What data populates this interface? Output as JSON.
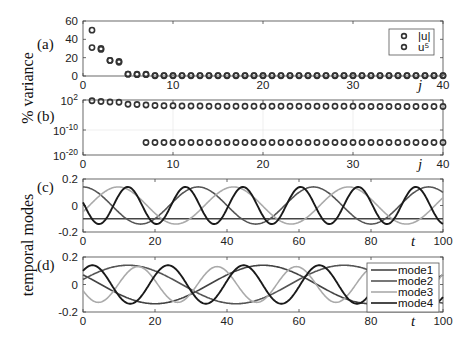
{
  "figure": {
    "ylabel_top": "% variance",
    "ylabel_bottom": "temporal modes"
  },
  "chart_data": [
    {
      "id": "a",
      "type": "scatter",
      "panel_label": "(a)",
      "title": "",
      "xlabel": "j",
      "ylabel": "% variance",
      "xlim": [
        0,
        40
      ],
      "ylim": [
        0,
        60
      ],
      "xticks": [
        0,
        10,
        20,
        30,
        40
      ],
      "yticks": [
        0,
        20,
        40,
        60
      ],
      "ytick_labels": [
        "0",
        "20",
        "40",
        "60"
      ],
      "xtick_labels": [
        "0",
        "10",
        "20",
        "30",
        "40"
      ],
      "grid": false,
      "legend": {
        "placement": "top-right",
        "entries": [
          "|u|",
          "u⁵"
        ]
      },
      "series": [
        {
          "name": "|u|",
          "x": [
            1,
            2,
            3,
            4,
            5,
            6,
            7,
            8,
            9,
            10,
            11,
            12,
            13,
            14,
            15,
            16,
            17,
            18,
            19,
            20,
            21,
            22,
            23,
            24,
            25,
            26,
            27,
            28,
            29,
            30,
            31,
            32,
            33,
            34,
            35,
            36,
            37,
            38,
            39,
            40
          ],
          "y": [
            50,
            30,
            17,
            16,
            2,
            2,
            2,
            0.5,
            0.5,
            0.5,
            0.5,
            0.5,
            0.5,
            0.5,
            0.5,
            0.5,
            0.5,
            0.5,
            0.5,
            0.5,
            0.5,
            0.5,
            0.5,
            0.5,
            0.5,
            0.5,
            0.5,
            0.5,
            0.5,
            0.5,
            0.5,
            0.5,
            0.5,
            0.5,
            0.5,
            0.5,
            0.5,
            0.5,
            0.5,
            0.5
          ]
        },
        {
          "name": "u⁵",
          "x": [
            1,
            2,
            3,
            4,
            5,
            6,
            7,
            8,
            9,
            10,
            11,
            12,
            13,
            14,
            15,
            16,
            17,
            18,
            19,
            20,
            21,
            22,
            23,
            24,
            25,
            26,
            27,
            28,
            29,
            30,
            31,
            32,
            33,
            34,
            35,
            36,
            37,
            38,
            39,
            40
          ],
          "y": [
            31,
            29,
            17,
            15,
            2,
            1.5,
            1.5,
            0.3,
            0.3,
            0.3,
            0.3,
            0.3,
            0.3,
            0.3,
            0.3,
            0.3,
            0.3,
            0.3,
            0.3,
            0.3,
            0.3,
            0.3,
            0.3,
            0.3,
            0.3,
            0.3,
            0.3,
            0.3,
            0.3,
            0.3,
            0.3,
            0.3,
            0.3,
            0.3,
            0.3,
            0.3,
            0.3,
            0.3,
            0.3,
            0.3
          ]
        }
      ]
    },
    {
      "id": "b",
      "type": "scatter",
      "panel_label": "(b)",
      "xlabel": "j",
      "ylabel": "% variance (log scale)",
      "xlim": [
        0,
        40
      ],
      "ylim_log10": [
        -20,
        2
      ],
      "xticks": [
        0,
        10,
        20,
        30,
        40
      ],
      "xtick_labels": [
        "0",
        "10",
        "20",
        "30",
        "40"
      ],
      "yticks_log10": [
        -20,
        -10,
        2
      ],
      "ytick_labels": [
        {
          "base": "10",
          "exp": "-20"
        },
        {
          "base": "10",
          "exp": "-10"
        },
        {
          "base": "10",
          "exp": "2"
        }
      ],
      "grid": true,
      "series": [
        {
          "name": "|u| log10",
          "x": [
            1,
            2,
            3,
            4,
            5,
            6,
            7,
            8,
            9,
            10,
            11,
            12,
            13,
            14,
            15,
            16,
            17,
            18,
            19,
            20,
            21,
            22,
            23,
            24,
            25,
            26,
            27,
            28,
            29,
            30,
            31,
            32,
            33,
            34,
            35,
            36,
            37,
            38,
            39,
            40
          ],
          "y_log10": [
            1.7,
            1.4,
            1.2,
            1.1,
            0.3,
            0.2,
            0,
            -0.2,
            -0.3,
            -0.3,
            -0.4,
            -0.4,
            -0.4,
            -0.5,
            -0.5,
            -0.5,
            -0.5,
            -0.5,
            -0.5,
            -0.5,
            -0.5,
            -0.5,
            -0.5,
            -0.5,
            -0.5,
            -0.5,
            -0.5,
            -0.5,
            -0.5,
            -0.5,
            -0.5,
            -0.6,
            -0.6,
            -0.6,
            -0.6,
            -0.6,
            -0.6,
            -0.6,
            -0.6,
            -0.6
          ]
        },
        {
          "name": "u⁵ log10",
          "x": [
            7,
            8,
            9,
            10,
            11,
            12,
            13,
            14,
            15,
            16,
            17,
            18,
            19,
            20,
            21,
            22,
            23,
            24,
            25,
            26,
            27,
            28,
            29,
            30,
            31,
            32,
            33,
            34,
            35,
            36,
            37,
            38,
            39,
            40
          ],
          "y_log10": [
            -15,
            -15,
            -15,
            -15,
            -15,
            -15,
            -15,
            -15,
            -15,
            -15,
            -15,
            -15,
            -15,
            -15,
            -15,
            -15,
            -15,
            -15,
            -15,
            -15,
            -15,
            -15,
            -15,
            -15,
            -15,
            -15,
            -15,
            -15,
            -15,
            -15,
            -15,
            -15,
            -15,
            -15
          ]
        }
      ]
    },
    {
      "id": "c",
      "type": "line",
      "panel_label": "(c)",
      "xlabel": "t",
      "ylabel": "temporal modes",
      "xlim": [
        0,
        100
      ],
      "ylim": [
        -0.2,
        0.2
      ],
      "xticks": [
        0,
        20,
        40,
        60,
        80,
        100
      ],
      "xtick_labels": [
        "0",
        "20",
        "40",
        "60",
        "80",
        "100"
      ],
      "yticks": [
        -0.2,
        0,
        0.2
      ],
      "ytick_labels": [
        "-0.2",
        "0",
        "0.2"
      ],
      "grid": false,
      "series": [
        {
          "name": "mode1",
          "color": "#444444",
          "kind": "constant",
          "value": -0.1
        },
        {
          "name": "mode2",
          "color": "#555555",
          "kind": "sine",
          "amplitude": 0.14,
          "period": 32,
          "phase_deg": 90
        },
        {
          "name": "mode3",
          "color": "#aaaaaa",
          "kind": "sine",
          "amplitude": 0.14,
          "period": 32,
          "phase_deg": -20
        },
        {
          "name": "mode4",
          "color": "#1a1a1a",
          "kind": "sine",
          "amplitude": 0.14,
          "period": 16,
          "phase_deg": 170
        }
      ]
    },
    {
      "id": "d",
      "type": "line",
      "panel_label": "(d)",
      "xlabel": "t",
      "ylabel": "temporal modes",
      "xlim": [
        0,
        100
      ],
      "ylim": [
        -0.2,
        0.2
      ],
      "xticks": [
        0,
        20,
        40,
        60,
        80,
        100
      ],
      "xtick_labels": [
        "0",
        "20",
        "40",
        "60",
        "80",
        "100"
      ],
      "yticks": [
        -0.2,
        0,
        0.2
      ],
      "ytick_labels": [
        "-0.2",
        "0",
        "0.2"
      ],
      "grid": false,
      "legend": {
        "placement": "bottom-right",
        "entries": [
          "mode1",
          "mode2",
          "mode3",
          "mode4"
        ]
      },
      "series": [
        {
          "name": "mode1",
          "color": "#444444",
          "kind": "sine",
          "amplitude": 0.14,
          "period": 60,
          "phase_deg": -90,
          "offset_t": -20
        },
        {
          "name": "mode2",
          "color": "#555555",
          "kind": "sine",
          "amplitude": 0.14,
          "period": 60,
          "phase_deg": 15
        },
        {
          "name": "mode3",
          "color": "#aaaaaa",
          "kind": "sine",
          "amplitude": 0.13,
          "period": 22,
          "phase_deg": -160
        },
        {
          "name": "mode4",
          "color": "#1a1a1a",
          "kind": "sine",
          "amplitude": 0.14,
          "period": 21,
          "phase_deg": 45
        }
      ]
    }
  ]
}
